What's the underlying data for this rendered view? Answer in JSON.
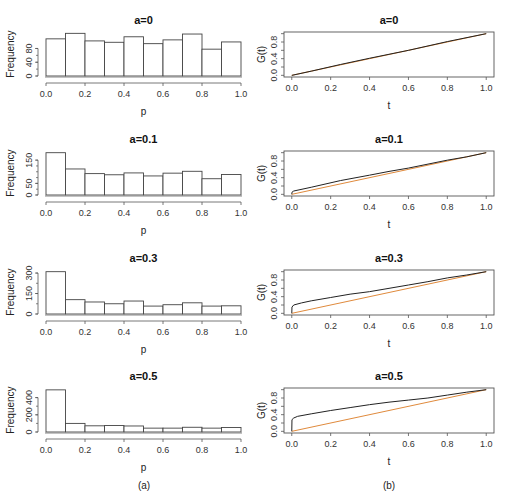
{
  "captions": {
    "left": "(a)",
    "right": "(b)"
  },
  "colors": {
    "bar_edge": "#444444",
    "bar_fill": "#ffffff",
    "axis": "#555555",
    "empirical_line": "#222222",
    "reference_line": "#e08a3c"
  },
  "chart_data": [
    {
      "type": "bar",
      "panel": "a",
      "title": "a=0",
      "xlabel": "p",
      "ylabel": "Frequency",
      "bin_edges": [
        0.0,
        0.1,
        0.2,
        0.3,
        0.4,
        0.5,
        0.6,
        0.7,
        0.8,
        0.9,
        1.0
      ],
      "values": [
        108,
        124,
        102,
        98,
        114,
        94,
        105,
        122,
        78,
        99
      ],
      "xticks": [
        "0.0",
        "0.2",
        "0.4",
        "0.6",
        "0.8",
        "1.0"
      ],
      "yticks": [
        0,
        40,
        80
      ],
      "ylim": [
        0,
        125
      ]
    },
    {
      "type": "line",
      "panel": "b",
      "title": "a=0",
      "xlabel": "t",
      "ylabel": "G(t)",
      "xticks": [
        "0.0",
        "0.2",
        "0.4",
        "0.6",
        "0.8",
        "1.0"
      ],
      "yticks": [
        "0.0",
        "0.4",
        "0.8"
      ],
      "xlim": [
        -0.04,
        1.04
      ],
      "ylim": [
        -0.04,
        1.04
      ],
      "series": [
        {
          "name": "G(t)",
          "x": [
            0,
            0.001,
            0.1,
            0.25,
            0.4,
            0.6,
            0.8,
            1.0
          ],
          "y": [
            0,
            0.0,
            0.1,
            0.26,
            0.41,
            0.6,
            0.81,
            1.0
          ]
        },
        {
          "name": "reference y=t",
          "x": [
            0,
            1
          ],
          "y": [
            0,
            1
          ]
        }
      ]
    },
    {
      "type": "bar",
      "panel": "a",
      "title": "a=0.1",
      "xlabel": "p",
      "ylabel": "Frequency",
      "bin_edges": [
        0.0,
        0.1,
        0.2,
        0.3,
        0.4,
        0.5,
        0.6,
        0.7,
        0.8,
        0.9,
        1.0
      ],
      "values": [
        182,
        112,
        92,
        87,
        95,
        82,
        94,
        102,
        70,
        88
      ],
      "xticks": [
        "0.0",
        "0.2",
        "0.4",
        "0.6",
        "0.8",
        "1.0"
      ],
      "yticks": [
        0,
        50,
        150
      ],
      "ylim": [
        0,
        185
      ]
    },
    {
      "type": "line",
      "panel": "b",
      "title": "a=0.1",
      "xlabel": "t",
      "ylabel": "G(t)",
      "xticks": [
        "0.0",
        "0.2",
        "0.4",
        "0.6",
        "0.8",
        "1.0"
      ],
      "yticks": [
        "0.0",
        "0.4",
        "0.8"
      ],
      "xlim": [
        -0.04,
        1.04
      ],
      "ylim": [
        -0.04,
        1.04
      ],
      "series": [
        {
          "name": "G(t)",
          "x": [
            0,
            0.001,
            0.01,
            0.1,
            0.25,
            0.4,
            0.5,
            0.6,
            0.8,
            0.9,
            1.0
          ],
          "y": [
            0,
            0.05,
            0.08,
            0.17,
            0.33,
            0.46,
            0.55,
            0.63,
            0.82,
            0.9,
            1.0
          ]
        },
        {
          "name": "reference y=t",
          "x": [
            0,
            1
          ],
          "y": [
            0,
            1
          ]
        }
      ]
    },
    {
      "type": "bar",
      "panel": "a",
      "title": "a=0.3",
      "xlabel": "p",
      "ylabel": "Frequency",
      "bin_edges": [
        0.0,
        0.1,
        0.2,
        0.3,
        0.4,
        0.5,
        0.6,
        0.7,
        0.8,
        0.9,
        1.0
      ],
      "values": [
        310,
        105,
        88,
        75,
        95,
        58,
        68,
        82,
        58,
        60
      ],
      "xticks": [
        "0.0",
        "0.2",
        "0.4",
        "0.6",
        "0.8",
        "1.0"
      ],
      "yticks": [
        0,
        150,
        300
      ],
      "ylim": [
        0,
        315
      ]
    },
    {
      "type": "line",
      "panel": "b",
      "title": "a=0.3",
      "xlabel": "t",
      "ylabel": "G(t)",
      "xticks": [
        "0.0",
        "0.2",
        "0.4",
        "0.6",
        "0.8",
        "1.0"
      ],
      "yticks": [
        "0.0",
        "0.4",
        "0.8"
      ],
      "xlim": [
        -0.04,
        1.04
      ],
      "ylim": [
        -0.04,
        1.04
      ],
      "series": [
        {
          "name": "G(t)",
          "x": [
            0,
            0.001,
            0.01,
            0.05,
            0.1,
            0.2,
            0.3,
            0.4,
            0.5,
            0.6,
            0.7,
            0.8,
            0.9,
            1.0
          ],
          "y": [
            0,
            0.15,
            0.2,
            0.25,
            0.3,
            0.38,
            0.46,
            0.52,
            0.6,
            0.68,
            0.76,
            0.85,
            0.92,
            1.0
          ]
        },
        {
          "name": "reference y=t",
          "x": [
            0,
            1
          ],
          "y": [
            0,
            1
          ]
        }
      ]
    },
    {
      "type": "bar",
      "panel": "a",
      "title": "a=0.5",
      "xlabel": "p",
      "ylabel": "Frequency",
      "bin_edges": [
        0.0,
        0.1,
        0.2,
        0.3,
        0.4,
        0.5,
        0.6,
        0.7,
        0.8,
        0.9,
        1.0
      ],
      "values": [
        490,
        100,
        72,
        75,
        70,
        45,
        45,
        55,
        45,
        52
      ],
      "xticks": [
        "0.0",
        "0.2",
        "0.4",
        "0.6",
        "0.8",
        "1.0"
      ],
      "yticks": [
        0,
        200,
        400
      ],
      "ylim": [
        0,
        500
      ]
    },
    {
      "type": "line",
      "panel": "b",
      "title": "a=0.5",
      "xlabel": "t",
      "ylabel": "G(t)",
      "xticks": [
        "0.0",
        "0.2",
        "0.4",
        "0.6",
        "0.8",
        "1.0"
      ],
      "yticks": [
        "0.0",
        "0.4",
        "0.8"
      ],
      "xlim": [
        -0.04,
        1.04
      ],
      "ylim": [
        -0.04,
        1.04
      ],
      "series": [
        {
          "name": "G(t)",
          "x": [
            0,
            0.001,
            0.01,
            0.03,
            0.1,
            0.2,
            0.3,
            0.4,
            0.5,
            0.6,
            0.7,
            0.8,
            0.9,
            1.0
          ],
          "y": [
            0,
            0.28,
            0.32,
            0.36,
            0.42,
            0.5,
            0.57,
            0.64,
            0.7,
            0.75,
            0.8,
            0.87,
            0.94,
            1.0
          ]
        },
        {
          "name": "reference y=t",
          "x": [
            0,
            1
          ],
          "y": [
            0,
            1
          ]
        }
      ]
    }
  ]
}
